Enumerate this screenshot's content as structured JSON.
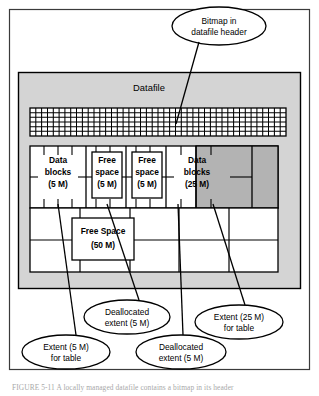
{
  "figure": {
    "type": "diagram",
    "canvas": {
      "width": 319,
      "height": 396
    },
    "colors": {
      "datafile_fill": "#d4d4d4",
      "extent_free_fill": "#ffffff",
      "extent_allocated_fill": "#b3b3b3",
      "stroke": "#000000",
      "page_background": "#ffffff",
      "caption_text": "#a8a8a8"
    }
  },
  "outer_frame": {
    "name": "figure-border",
    "visible": true
  },
  "datafile": {
    "title": "Datafile",
    "bitmap": {
      "label": "bitmap-grid",
      "columns": 44,
      "rows": 6
    }
  },
  "callouts": [
    {
      "id": "bitmap-callout",
      "lines": [
        "Bitmap in",
        "datafile header"
      ],
      "position": "top"
    },
    {
      "id": "deallocated-extent-upper-callout",
      "lines": [
        "Deallocated",
        "extent (5 M)"
      ],
      "position": "bottom"
    },
    {
      "id": "extent-25m-callout",
      "lines": [
        "Extent (25 M)",
        "for table"
      ],
      "position": "bottom"
    },
    {
      "id": "extent-5m-callout",
      "lines": [
        "Extent (5 M)",
        "for table"
      ],
      "position": "bottom"
    },
    {
      "id": "deallocated-extent-lower-callout",
      "lines": [
        "Deallocated",
        "extent (5 M)"
      ],
      "position": "bottom"
    }
  ],
  "extents": [
    {
      "id": "extent-data-blocks-5m",
      "lines": [
        "Data",
        "blocks",
        "(5 M)"
      ],
      "kind": "allocated",
      "size": "5 M",
      "boxed_label": false
    },
    {
      "id": "extent-free-space-5m-a",
      "lines": [
        "Free",
        "space",
        "(5 M)"
      ],
      "kind": "free",
      "size": "5 M",
      "boxed_label": true
    },
    {
      "id": "extent-free-space-5m-b",
      "lines": [
        "Free",
        "space",
        "(5 M)"
      ],
      "kind": "free",
      "size": "5 M",
      "boxed_label": true
    },
    {
      "id": "extent-data-blocks-25m",
      "lines": [
        "Data",
        "blocks",
        "(25 M)"
      ],
      "kind": "allocated",
      "size": "25 M",
      "boxed_label": false
    }
  ],
  "free_space_region": {
    "id": "free-space-50m",
    "lines": [
      "Free Space",
      "(50 M)"
    ],
    "size": "50 M"
  },
  "caption": {
    "text": "FIGURE 5-11   A locally managed datafile contains a bitmap in its header"
  }
}
